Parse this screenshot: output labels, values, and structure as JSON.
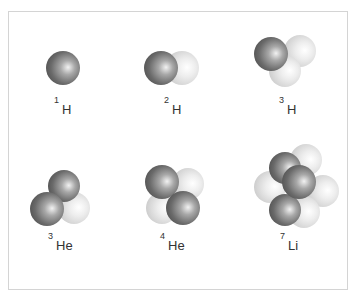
{
  "figure": {
    "title": "",
    "colors": {
      "proton": "#6e6e6e",
      "neutron": "#e6e6e6",
      "border": "#d4d4d4",
      "label": "#333333"
    },
    "nuclei": [
      {
        "id": "h1",
        "mass_number": "1",
        "symbol": "H",
        "label_pos": [
          54,
          98
        ],
        "particles": [
          {
            "type": "proton",
            "cx": 63,
            "cy": 68,
            "r": 17
          }
        ]
      },
      {
        "id": "h2",
        "mass_number": "2",
        "symbol": "H",
        "label_pos": [
          164,
          98
        ],
        "particles": [
          {
            "type": "neutron",
            "cx": 182,
            "cy": 68,
            "r": 17
          },
          {
            "type": "proton",
            "cx": 161,
            "cy": 68,
            "r": 17
          }
        ]
      },
      {
        "id": "h3",
        "mass_number": "3",
        "symbol": "H",
        "label_pos": [
          279,
          98
        ],
        "particles": [
          {
            "type": "neutron",
            "cx": 300,
            "cy": 51,
            "r": 16
          },
          {
            "type": "neutron",
            "cx": 285,
            "cy": 71,
            "r": 16
          },
          {
            "type": "proton",
            "cx": 271,
            "cy": 54,
            "r": 17
          }
        ]
      },
      {
        "id": "he3",
        "mass_number": "3",
        "symbol": "He",
        "label_pos": [
          48,
          234
        ],
        "particles": [
          {
            "type": "neutron",
            "cx": 74,
            "cy": 208,
            "r": 16
          },
          {
            "type": "proton",
            "cx": 64,
            "cy": 186,
            "r": 16
          },
          {
            "type": "proton",
            "cx": 47,
            "cy": 209,
            "r": 17
          }
        ]
      },
      {
        "id": "he4",
        "mass_number": "4",
        "symbol": "He",
        "label_pos": [
          160,
          234
        ],
        "particles": [
          {
            "type": "neutron",
            "cx": 188,
            "cy": 184,
            "r": 16
          },
          {
            "type": "neutron",
            "cx": 162,
            "cy": 208,
            "r": 16
          },
          {
            "type": "proton",
            "cx": 162,
            "cy": 182,
            "r": 17
          },
          {
            "type": "proton",
            "cx": 183,
            "cy": 208,
            "r": 17
          }
        ]
      },
      {
        "id": "li7",
        "mass_number": "7",
        "symbol": "Li",
        "label_pos": [
          280,
          234
        ],
        "particles": [
          {
            "type": "neutron",
            "cx": 306,
            "cy": 160,
            "r": 16
          },
          {
            "type": "neutron",
            "cx": 270,
            "cy": 187,
            "r": 16
          },
          {
            "type": "neutron",
            "cx": 323,
            "cy": 191,
            "r": 16
          },
          {
            "type": "neutron",
            "cx": 304,
            "cy": 212,
            "r": 16
          },
          {
            "type": "proton",
            "cx": 285,
            "cy": 168,
            "r": 16
          },
          {
            "type": "proton",
            "cx": 285,
            "cy": 210,
            "r": 16
          },
          {
            "type": "proton",
            "cx": 299,
            "cy": 182,
            "r": 17
          }
        ]
      }
    ]
  }
}
